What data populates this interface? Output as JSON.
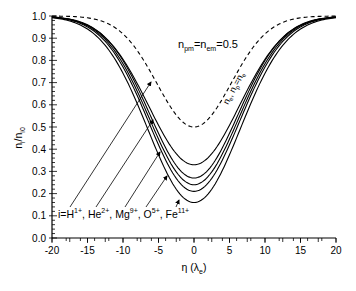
{
  "chart_data": {
    "type": "line",
    "title": "",
    "xlabel": "η (λ_e)",
    "xlabel_main": "η (λ",
    "xlabel_sub": "e",
    "xlabel_close": ")",
    "ylabel": "n_i/n_i0",
    "ylabel_main": "n",
    "ylabel_sub1": "i",
    "ylabel_mid": "/n",
    "ylabel_sub2": "i0",
    "xlim": [
      -20,
      20
    ],
    "ylim": [
      0.0,
      1.0
    ],
    "xticks": [
      -20,
      -15,
      -10,
      -5,
      0,
      5,
      10,
      15,
      20
    ],
    "xtick_labels": [
      "-20",
      "-15",
      "-10",
      "-5",
      "0",
      "5",
      "10",
      "15",
      "20"
    ],
    "yticks": [
      0.0,
      0.1,
      0.2,
      0.3,
      0.4,
      0.5,
      0.6,
      0.7,
      0.8,
      0.9,
      1.0
    ],
    "ytick_labels": [
      "0.0",
      "0.1",
      "0.2",
      "0.3",
      "0.4",
      "0.5",
      "0.6",
      "0.7",
      "0.8",
      "0.9",
      "1.0"
    ],
    "grid": false,
    "legend": "none (inline annotations with arrows)",
    "annotations": {
      "parameter": {
        "main1": "n",
        "sub1": "pm",
        "mid": "=n",
        "sub2": "em",
        "tail": "=0.5",
        "full": "n_pm=n_em=0.5"
      },
      "dashed_label": {
        "full": "n_e, n_p=n_e"
      },
      "ion_label": {
        "prefix": "i=",
        "ions": [
          {
            "name": "H",
            "charge": "1+"
          },
          {
            "name": "He",
            "charge": "2+"
          },
          {
            "name": "Mg",
            "charge": "9+"
          },
          {
            "name": "O",
            "charge": "5+"
          },
          {
            "name": "Fe",
            "charge": "11+"
          }
        ]
      }
    },
    "x": [
      -20,
      -18,
      -16,
      -14,
      -12,
      -10,
      -8,
      -6,
      -4,
      -2,
      0,
      2,
      4,
      6,
      8,
      10,
      12,
      14,
      16,
      18,
      20
    ],
    "series": [
      {
        "name": "n_e, n_p=n_e",
        "style": "dashed",
        "min": 0.5,
        "width": 7.4,
        "values": [
          1.0,
          1.0,
          0.99,
          0.97,
          0.93,
          0.86,
          0.76,
          0.66,
          0.57,
          0.52,
          0.5,
          0.52,
          0.57,
          0.66,
          0.76,
          0.86,
          0.93,
          0.97,
          0.99,
          1.0,
          1.0
        ]
      },
      {
        "name": "H1+",
        "style": "solid",
        "min": 0.33,
        "width": 9.0,
        "values": [
          1.0,
          0.99,
          0.97,
          0.91,
          0.83,
          0.72,
          0.6,
          0.49,
          0.41,
          0.36,
          0.33,
          0.36,
          0.41,
          0.49,
          0.6,
          0.72,
          0.83,
          0.91,
          0.97,
          0.99,
          1.0
        ]
      },
      {
        "name": "He2+",
        "style": "solid",
        "min": 0.27,
        "width": 8.8,
        "values": [
          1.0,
          0.99,
          0.96,
          0.9,
          0.81,
          0.69,
          0.56,
          0.44,
          0.35,
          0.3,
          0.27,
          0.3,
          0.35,
          0.44,
          0.56,
          0.69,
          0.81,
          0.9,
          0.96,
          0.99,
          1.0
        ]
      },
      {
        "name": "Mg9+",
        "style": "solid",
        "min": 0.24,
        "width": 8.9,
        "values": [
          1.0,
          0.99,
          0.96,
          0.9,
          0.8,
          0.68,
          0.54,
          0.42,
          0.32,
          0.26,
          0.24,
          0.26,
          0.32,
          0.42,
          0.54,
          0.68,
          0.8,
          0.9,
          0.96,
          0.99,
          1.0
        ]
      },
      {
        "name": "O5+",
        "style": "solid",
        "min": 0.21,
        "width": 9.0,
        "values": [
          1.0,
          0.99,
          0.96,
          0.89,
          0.79,
          0.66,
          0.52,
          0.39,
          0.3,
          0.24,
          0.21,
          0.24,
          0.3,
          0.39,
          0.52,
          0.66,
          0.79,
          0.89,
          0.96,
          0.99,
          1.0
        ]
      },
      {
        "name": "Fe11+",
        "style": "solid",
        "min": 0.16,
        "width": 9.2,
        "values": [
          1.0,
          0.99,
          0.96,
          0.88,
          0.77,
          0.63,
          0.49,
          0.36,
          0.26,
          0.19,
          0.16,
          0.19,
          0.26,
          0.36,
          0.49,
          0.63,
          0.77,
          0.88,
          0.96,
          0.99,
          1.0
        ]
      }
    ]
  }
}
